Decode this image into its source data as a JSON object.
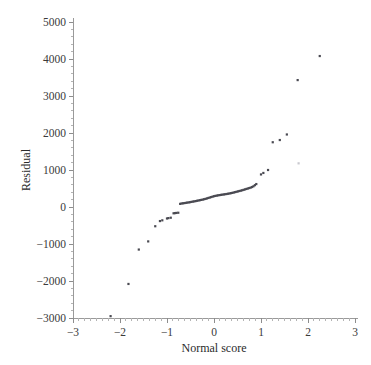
{
  "chart_data": {
    "type": "scatter",
    "title": "",
    "xlabel": "Normal score",
    "ylabel": "Residual",
    "xlim": [
      -3,
      3
    ],
    "ylim": [
      -3000,
      5000
    ],
    "xticks": [
      -3,
      -2,
      -1,
      0,
      1,
      2,
      3
    ],
    "xticklabels": [
      "−3",
      "−2",
      "−1",
      "0",
      "1",
      "2",
      "3"
    ],
    "yticks": [
      -3000,
      -2000,
      -1000,
      0,
      1000,
      2000,
      3000,
      4000,
      5000
    ],
    "yticklabels": [
      "−3000",
      "−2000",
      "−1000",
      "0",
      "1000",
      "2000",
      "3000",
      "4000",
      "5000"
    ],
    "grid": false,
    "legend": null,
    "minor_ticks": true,
    "marker": "square",
    "marker_color": "#4a4a52",
    "points": [
      {
        "x": -2.2,
        "y": -2950
      },
      {
        "x": -1.82,
        "y": -2080
      },
      {
        "x": -1.6,
        "y": -1150
      },
      {
        "x": -1.4,
        "y": -930
      },
      {
        "x": -1.25,
        "y": -520
      },
      {
        "x": -1.15,
        "y": -380
      },
      {
        "x": -1.1,
        "y": -360
      },
      {
        "x": -1.0,
        "y": -310
      },
      {
        "x": -0.97,
        "y": -300
      },
      {
        "x": -0.92,
        "y": -290
      },
      {
        "x": -0.86,
        "y": -170
      },
      {
        "x": -0.83,
        "y": -165
      },
      {
        "x": -0.8,
        "y": -160
      },
      {
        "x": -0.76,
        "y": -155
      },
      {
        "x": -0.72,
        "y": 85
      },
      {
        "x": -0.69,
        "y": 95
      },
      {
        "x": -0.66,
        "y": 100
      },
      {
        "x": -0.63,
        "y": 105
      },
      {
        "x": -0.6,
        "y": 112
      },
      {
        "x": -0.57,
        "y": 118
      },
      {
        "x": -0.54,
        "y": 124
      },
      {
        "x": -0.51,
        "y": 130
      },
      {
        "x": -0.48,
        "y": 138
      },
      {
        "x": -0.45,
        "y": 146
      },
      {
        "x": -0.42,
        "y": 152
      },
      {
        "x": -0.39,
        "y": 160
      },
      {
        "x": -0.36,
        "y": 168
      },
      {
        "x": -0.33,
        "y": 176
      },
      {
        "x": -0.3,
        "y": 184
      },
      {
        "x": -0.27,
        "y": 192
      },
      {
        "x": -0.24,
        "y": 200
      },
      {
        "x": -0.21,
        "y": 210
      },
      {
        "x": -0.18,
        "y": 220
      },
      {
        "x": -0.15,
        "y": 232
      },
      {
        "x": -0.12,
        "y": 244
      },
      {
        "x": -0.09,
        "y": 256
      },
      {
        "x": -0.06,
        "y": 268
      },
      {
        "x": -0.03,
        "y": 280
      },
      {
        "x": 0.0,
        "y": 292
      },
      {
        "x": 0.03,
        "y": 300
      },
      {
        "x": 0.06,
        "y": 308
      },
      {
        "x": 0.09,
        "y": 316
      },
      {
        "x": 0.12,
        "y": 322
      },
      {
        "x": 0.15,
        "y": 328
      },
      {
        "x": 0.18,
        "y": 334
      },
      {
        "x": 0.21,
        "y": 340
      },
      {
        "x": 0.24,
        "y": 346
      },
      {
        "x": 0.27,
        "y": 352
      },
      {
        "x": 0.3,
        "y": 358
      },
      {
        "x": 0.33,
        "y": 366
      },
      {
        "x": 0.36,
        "y": 374
      },
      {
        "x": 0.39,
        "y": 382
      },
      {
        "x": 0.42,
        "y": 392
      },
      {
        "x": 0.45,
        "y": 402
      },
      {
        "x": 0.48,
        "y": 412
      },
      {
        "x": 0.51,
        "y": 422
      },
      {
        "x": 0.54,
        "y": 432
      },
      {
        "x": 0.57,
        "y": 442
      },
      {
        "x": 0.6,
        "y": 452
      },
      {
        "x": 0.63,
        "y": 464
      },
      {
        "x": 0.66,
        "y": 476
      },
      {
        "x": 0.69,
        "y": 488
      },
      {
        "x": 0.72,
        "y": 500
      },
      {
        "x": 0.75,
        "y": 512
      },
      {
        "x": 0.78,
        "y": 524
      },
      {
        "x": 0.81,
        "y": 540
      },
      {
        "x": 0.84,
        "y": 560
      },
      {
        "x": 0.87,
        "y": 590
      },
      {
        "x": 0.9,
        "y": 620
      },
      {
        "x": 1.0,
        "y": 880
      },
      {
        "x": 1.05,
        "y": 920
      },
      {
        "x": 1.15,
        "y": 1000
      },
      {
        "x": 1.25,
        "y": 1750
      },
      {
        "x": 1.4,
        "y": 1810
      },
      {
        "x": 1.55,
        "y": 1960
      },
      {
        "x": 1.78,
        "y": 3430
      },
      {
        "x": 2.25,
        "y": 4080
      }
    ],
    "faint_points": [
      {
        "x": 1.8,
        "y": 1180
      }
    ]
  },
  "layout": {
    "plot_left_px": 73,
    "plot_right_px": 355,
    "plot_top_px": 22,
    "plot_bottom_px": 318
  }
}
